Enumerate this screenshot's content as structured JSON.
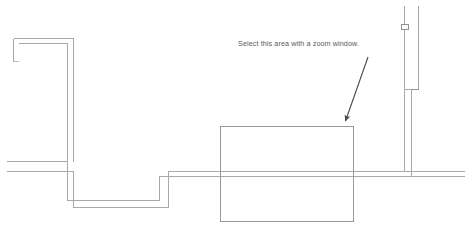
{
  "drawing": {
    "title": "Plumbing / wall section detail",
    "background_color": "#ffffff",
    "line_color": "#a8a8a8",
    "line_color_dark": "#8f8f8f",
    "text_color": "#5a5a5a",
    "arrow_color": "#4a4a4a",
    "line_width": 1,
    "canvas": {
      "width": 465,
      "height": 236
    }
  },
  "annotation": {
    "label": "Select this area with a zoom window.",
    "x": 238,
    "y": 39,
    "arrow": {
      "from_x": 368,
      "from_y": 57,
      "to_x": 344,
      "to_y": 125
    }
  },
  "zoom_window": {
    "name": "zoom-target-rectangle",
    "x": 220,
    "y": 127,
    "width": 133,
    "height": 95
  },
  "geometry": {
    "wall_upper_left": {
      "outer": "M 13,38 L 73,38 L 73,90",
      "inner": "M 18,43 L 68,43 L 68,90",
      "stub": "M 13,38 L 13,60"
    },
    "grade_line_upper": {
      "y": 161,
      "x1": 6,
      "x2": 66
    },
    "grade_line_lower": {
      "y": 171,
      "x1": 6,
      "x2": 72
    },
    "step_profile_outer": "M 66,161 L 66,200 L 160,200 L 160,176 L 465,176",
    "step_profile_inner": "M 72,171 L 72,208 L 168,208 L 168,172 L 465,172",
    "riser_outer": "M 404,5 L 404,25",
    "riser_inner": "M 418,5 L 418,90",
    "riser_fitting": {
      "x": 405,
      "y": 24,
      "width": 7,
      "height": 4
    },
    "drop_pipe_outer": "M 404,30 L 404,90 L 412,90 L 412,176",
    "drop_pipe_inner": "M 418,90 L 418,172",
    "elbow_detail": "M 404,90 L 418,90"
  },
  "elements": [
    {
      "name": "upper-left-wall",
      "type": "double-line-wall"
    },
    {
      "name": "vertical-riser-pipe",
      "type": "double-line-pipe"
    },
    {
      "name": "pipe-fitting",
      "type": "square-fitting"
    },
    {
      "name": "grade-line",
      "type": "horizontal-line"
    },
    {
      "name": "stepped-footing",
      "type": "stepped-profile"
    },
    {
      "name": "zoom-target-rectangle",
      "type": "rectangle"
    },
    {
      "name": "callout-arrow",
      "type": "arrow"
    },
    {
      "name": "callout-text",
      "type": "text"
    }
  ]
}
